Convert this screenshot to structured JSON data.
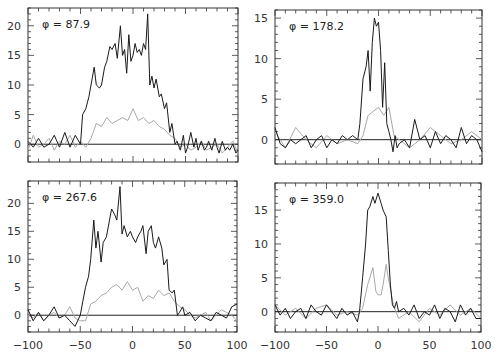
{
  "chart_data": [
    {
      "type": "line",
      "panel": "top-left",
      "annotation": "φ = 87.9",
      "xlim": [
        -100,
        100
      ],
      "ylim": [
        -3,
        23
      ],
      "yticks": [
        0,
        5,
        10,
        15,
        20
      ],
      "xticks": [
        -100,
        -50,
        0,
        50,
        100
      ],
      "show_x_labels": false,
      "series": [
        {
          "name": "dark",
          "color": "#1a1a1a",
          "x": [
            -100,
            -95,
            -90,
            -85,
            -80,
            -75,
            -70,
            -65,
            -60,
            -55,
            -50,
            -48,
            -45,
            -42,
            -40,
            -37,
            -35,
            -32,
            -30,
            -27,
            -25,
            -22,
            -20,
            -17,
            -15,
            -12,
            -10,
            -8,
            -6,
            -4,
            -2,
            0,
            2,
            4,
            6,
            8,
            10,
            12,
            14,
            16,
            18,
            20,
            22,
            25,
            27,
            30,
            32,
            35,
            37,
            40,
            42,
            45,
            48,
            50,
            52,
            55,
            58,
            60,
            62,
            65,
            68,
            70,
            72,
            75,
            78,
            80,
            82,
            85,
            88,
            90,
            92,
            95,
            98,
            100
          ],
          "y": [
            0.5,
            -0.5,
            1,
            -0.5,
            0,
            1.5,
            -0.5,
            2,
            -0.5,
            1.5,
            0,
            5,
            6,
            8,
            10,
            13,
            10,
            9.5,
            10,
            13,
            14,
            16.5,
            16,
            17,
            14.5,
            20,
            15,
            16,
            12,
            18.5,
            14,
            15,
            17,
            15.5,
            16,
            15,
            17,
            16,
            22,
            10,
            11.5,
            9.5,
            11,
            8,
            8.5,
            6,
            7,
            2,
            3.5,
            0,
            0.5,
            -1,
            1.5,
            -1.5,
            -0.5,
            2,
            -0.5,
            1,
            -1,
            0.5,
            -1,
            -0.5,
            0.5,
            -1,
            1,
            -0.5,
            -1.5,
            0.5,
            -1,
            -0.5,
            -1,
            0,
            -1.5,
            -1
          ]
        },
        {
          "name": "light",
          "color": "#a8a8a8",
          "x": [
            -100,
            -95,
            -90,
            -85,
            -80,
            -75,
            -70,
            -65,
            -60,
            -55,
            -50,
            -45,
            -40,
            -35,
            -30,
            -25,
            -20,
            -15,
            -10,
            -5,
            0,
            5,
            10,
            15,
            20,
            25,
            30,
            35,
            40,
            45,
            50,
            55,
            60,
            65,
            70,
            75,
            80,
            85,
            90,
            95,
            100
          ],
          "y": [
            -1,
            1.5,
            -0.5,
            0,
            1,
            -1,
            0.5,
            0,
            1.5,
            -0.5,
            0.5,
            -0.5,
            1,
            3.5,
            3,
            4.5,
            3.5,
            4,
            4.5,
            4,
            6,
            4,
            4.5,
            3.5,
            4,
            3,
            2.5,
            1.5,
            1,
            -0.5,
            0,
            -1,
            -0.5,
            0.5,
            -1,
            -0.5,
            0,
            -1.5,
            -0.5,
            0.5,
            -1.5
          ]
        }
      ]
    },
    {
      "type": "line",
      "panel": "top-right",
      "annotation": "φ = 178.2",
      "xlim": [
        -100,
        100
      ],
      "ylim": [
        -3,
        16
      ],
      "yticks": [
        0,
        5,
        10,
        15
      ],
      "xticks": [
        -100,
        -50,
        0,
        50,
        100
      ],
      "show_x_labels": false,
      "series": [
        {
          "name": "dark",
          "color": "#1a1a1a",
          "x": [
            -100,
            -95,
            -90,
            -85,
            -80,
            -75,
            -70,
            -65,
            -60,
            -55,
            -50,
            -45,
            -40,
            -35,
            -30,
            -25,
            -20,
            -18,
            -15,
            -12,
            -10,
            -8,
            -6,
            -4,
            -2,
            0,
            2,
            4,
            6,
            8,
            10,
            12,
            14,
            16,
            18,
            20,
            25,
            30,
            35,
            40,
            45,
            50,
            55,
            60,
            65,
            70,
            75,
            80,
            85,
            90,
            95,
            100
          ],
          "y": [
            1.5,
            -0.5,
            -1,
            0,
            -0.5,
            0,
            0.5,
            -1,
            0,
            0.5,
            -1,
            0,
            -0.5,
            0.5,
            0,
            0.5,
            0,
            2,
            7.5,
            9,
            11,
            6,
            12,
            15,
            14,
            14.5,
            11,
            4,
            9.5,
            2,
            1,
            0,
            -1.5,
            0.5,
            -1,
            -0.5,
            0,
            -1,
            2.5,
            0,
            0.5,
            -1,
            1,
            -0.5,
            0.5,
            0,
            -1,
            1.5,
            -0.5,
            0.5,
            0,
            -1.5
          ]
        },
        {
          "name": "light",
          "color": "#a8a8a8",
          "x": [
            -100,
            -90,
            -80,
            -70,
            -60,
            -50,
            -40,
            -30,
            -20,
            -15,
            -10,
            -5,
            0,
            5,
            10,
            15,
            20,
            30,
            40,
            50,
            60,
            70,
            80,
            90,
            100
          ],
          "y": [
            1,
            -1,
            1.5,
            0,
            -1,
            0.5,
            -0.5,
            0,
            -0.5,
            0.5,
            3,
            3.5,
            4,
            3,
            4,
            0.5,
            0,
            -1,
            0,
            1.5,
            0.5,
            -0.5,
            0,
            1,
            0
          ]
        }
      ]
    },
    {
      "type": "line",
      "panel": "bottom-left",
      "annotation": "φ = 267.6",
      "xlim": [
        -100,
        100
      ],
      "ylim": [
        -3,
        24
      ],
      "yticks": [
        0,
        5,
        10,
        15,
        20
      ],
      "xticks": [
        -100,
        -50,
        0,
        50,
        100
      ],
      "xtick_labels": [
        "-100",
        "-50",
        "0",
        "50",
        "100"
      ],
      "show_x_labels": true,
      "series": [
        {
          "name": "dark",
          "color": "#1a1a1a",
          "x": [
            -100,
            -95,
            -90,
            -85,
            -80,
            -75,
            -70,
            -65,
            -60,
            -55,
            -50,
            -48,
            -45,
            -42,
            -40,
            -37,
            -35,
            -33,
            -30,
            -28,
            -25,
            -22,
            -20,
            -17,
            -15,
            -12,
            -10,
            -8,
            -5,
            -2,
            0,
            3,
            5,
            8,
            10,
            13,
            15,
            18,
            20,
            22,
            25,
            28,
            30,
            33,
            35,
            38,
            40,
            43,
            45,
            48,
            50,
            55,
            60,
            65,
            70,
            75,
            80,
            85,
            90,
            95,
            100
          ],
          "y": [
            1,
            -1,
            0.5,
            -1,
            0,
            1.5,
            -0.5,
            0,
            -1,
            -2,
            0,
            2,
            5,
            7,
            10,
            17,
            12,
            15,
            9.5,
            13,
            14,
            17,
            19,
            18,
            17,
            23,
            14.5,
            16,
            14,
            15,
            14,
            13,
            14,
            15,
            16,
            11,
            15,
            16,
            13,
            12,
            14,
            12,
            9,
            10,
            4.5,
            4,
            4.5,
            0,
            0.5,
            1.5,
            0,
            0.5,
            -1,
            0,
            -0.5,
            -1,
            0.5,
            0,
            -0.5,
            1.5,
            2
          ]
        },
        {
          "name": "light",
          "color": "#a8a8a8",
          "x": [
            -100,
            -95,
            -90,
            -85,
            -80,
            -75,
            -70,
            -65,
            -60,
            -55,
            -50,
            -45,
            -40,
            -35,
            -30,
            -25,
            -20,
            -15,
            -10,
            -5,
            0,
            5,
            10,
            15,
            20,
            25,
            30,
            35,
            40,
            45,
            50,
            55,
            60,
            65,
            70,
            75,
            80,
            85,
            90,
            95,
            100
          ],
          "y": [
            0,
            -0.5,
            0.5,
            -1,
            0,
            0.5,
            -0.5,
            0,
            1.5,
            -0.5,
            -1,
            -1,
            2,
            2.5,
            3.5,
            4,
            5,
            5.5,
            4.5,
            6,
            4.5,
            5,
            2.5,
            3.5,
            3,
            4.5,
            3.5,
            4,
            2.5,
            1.5,
            1,
            0,
            -0.5,
            0,
            0.5,
            -1,
            0,
            1,
            0.5,
            0,
            -1
          ]
        }
      ]
    },
    {
      "type": "line",
      "panel": "bottom-right",
      "annotation": "φ = 359.0",
      "xlim": [
        -100,
        100
      ],
      "ylim": [
        -3,
        19
      ],
      "yticks": [
        0,
        5,
        10,
        15
      ],
      "xticks": [
        -100,
        -50,
        0,
        50,
        100
      ],
      "xtick_labels": [
        "-100",
        "-50",
        "0",
        "50",
        "100"
      ],
      "show_x_labels": true,
      "series": [
        {
          "name": "dark",
          "color": "#1a1a1a",
          "x": [
            -100,
            -95,
            -90,
            -85,
            -80,
            -75,
            -70,
            -65,
            -60,
            -55,
            -50,
            -45,
            -40,
            -35,
            -30,
            -25,
            -20,
            -18,
            -15,
            -12,
            -10,
            -8,
            -5,
            -3,
            0,
            3,
            5,
            8,
            10,
            12,
            14,
            16,
            18,
            20,
            25,
            30,
            35,
            40,
            45,
            50,
            55,
            60,
            65,
            70,
            75,
            80,
            85,
            90,
            95,
            100
          ],
          "y": [
            1,
            -0.5,
            0.5,
            -1,
            0,
            0.5,
            -1,
            1,
            0,
            -0.5,
            1,
            0,
            -1,
            0.5,
            -0.5,
            0,
            -1.5,
            0,
            5,
            10,
            15,
            15.5,
            17,
            16,
            17.5,
            16,
            15,
            14,
            9,
            4,
            1,
            0.5,
            1.5,
            0,
            0.5,
            -0.5,
            1,
            -1,
            0,
            -0.5,
            1,
            -1,
            0.5,
            0,
            -1.5,
            1,
            -0.5,
            0.5,
            -1,
            -1
          ]
        },
        {
          "name": "light",
          "color": "#a8a8a8",
          "x": [
            -100,
            -90,
            -80,
            -70,
            -60,
            -50,
            -40,
            -30,
            -20,
            -15,
            -10,
            -5,
            -2,
            0,
            3,
            5,
            8,
            10,
            15,
            20,
            30,
            40,
            50,
            60,
            70,
            80,
            90,
            100
          ],
          "y": [
            1,
            -0.5,
            0.5,
            -1,
            0.5,
            1,
            -0.5,
            0,
            -0.5,
            0.5,
            4,
            6.5,
            3,
            2.5,
            2.5,
            4,
            7,
            5,
            1,
            -1,
            0,
            -1.5,
            0.5,
            -0.5,
            1,
            -0.5,
            0.5,
            -1
          ]
        }
      ]
    }
  ]
}
